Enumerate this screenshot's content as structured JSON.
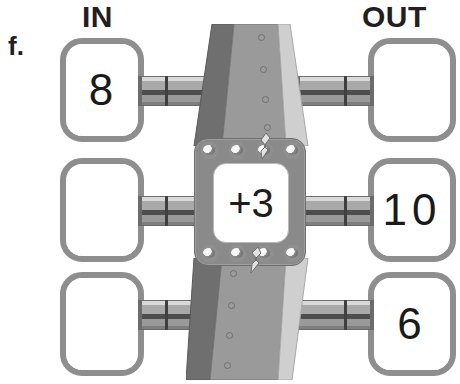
{
  "problem": {
    "label": "f."
  },
  "headers": {
    "in": "IN",
    "out": "OUT"
  },
  "machine": {
    "rule": "+3",
    "rule_operation": "add",
    "rule_value": 3,
    "bolt_count_top": 4,
    "bolt_count_bottom": 4
  },
  "rows": [
    {
      "in": "8",
      "out": ""
    },
    {
      "in": "",
      "out": "10"
    },
    {
      "in": "",
      "out": "6"
    }
  ],
  "colors": {
    "ink": "#231f20",
    "box_border": "#8e8e8e",
    "box_fill": "#ffffff",
    "machine_dark": "#6f6f6f",
    "machine_mid": "#9a9a9a",
    "machine_light": "#cfcfcf",
    "plate": "#8a8a8a",
    "pipe_shadow": "#4d4d4d"
  },
  "icons": {
    "bolt": "hex-bolt-icon",
    "rivet": "rivet-icon",
    "lever": "lever-icon",
    "pipe": "pipe-icon"
  }
}
